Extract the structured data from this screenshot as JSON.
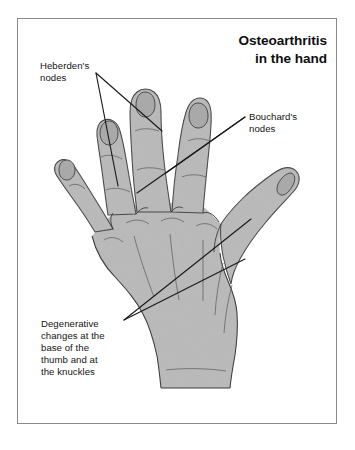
{
  "figure": {
    "title": "Osteoarthritis\nin the hand",
    "background_color": "#ffffff",
    "frame_color": "#8a8a8a",
    "text_color": "#141414",
    "hand_fill_color": "#b9b9b9",
    "hand_outline_color": "#3b3b3b",
    "leader_line_color": "#1a1a1a"
  },
  "labels": {
    "heberden": "Heberden's\nnodes",
    "bouchard": "Bouchard's\nnodes",
    "degenerative": "Degenerative\nchanges at the\nbase of the\nthumb and at\nthe knuckles"
  },
  "illustration": {
    "subject": "hand-dorsal-view-line-drawing",
    "parts": [
      "index-finger",
      "middle-finger",
      "ring-finger",
      "little-finger",
      "thumb",
      "palm",
      "wrist",
      "fingernails"
    ],
    "annotation_targets": {
      "heberden": "distal-interphalangeal-joints",
      "bouchard": "proximal-interphalangeal-joints",
      "degenerative": "thumb-base-and-knuckles"
    }
  }
}
